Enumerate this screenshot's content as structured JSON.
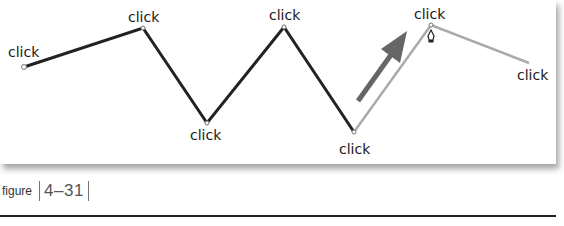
{
  "figure": {
    "caption_prefix": "figure",
    "caption_number": "4–31"
  },
  "diagram": {
    "labels": [
      {
        "text": "click",
        "x": 8,
        "y": 45
      },
      {
        "text": "click",
        "x": 128,
        "y": 10
      },
      {
        "text": "click",
        "x": 190,
        "y": 128
      },
      {
        "text": "click",
        "x": 269,
        "y": 8
      },
      {
        "text": "click",
        "x": 339,
        "y": 142
      },
      {
        "text": "click",
        "x": 414,
        "y": 7
      },
      {
        "text": "click",
        "x": 517,
        "y": 68
      }
    ],
    "dark_path_points": [
      [
        24,
        67
      ],
      [
        143,
        28
      ],
      [
        207,
        123
      ],
      [
        284,
        27
      ],
      [
        354,
        132
      ]
    ],
    "light_path_points": [
      [
        354,
        132
      ],
      [
        431,
        25
      ],
      [
        529,
        63
      ]
    ],
    "arrow": {
      "from": [
        358,
        101
      ],
      "to": [
        407,
        33
      ]
    },
    "colors": {
      "dark_line": "#222222",
      "light_line": "#aaaaaa",
      "arrow": "#666666"
    },
    "cursor_icon": "pen-tool-cursor"
  }
}
